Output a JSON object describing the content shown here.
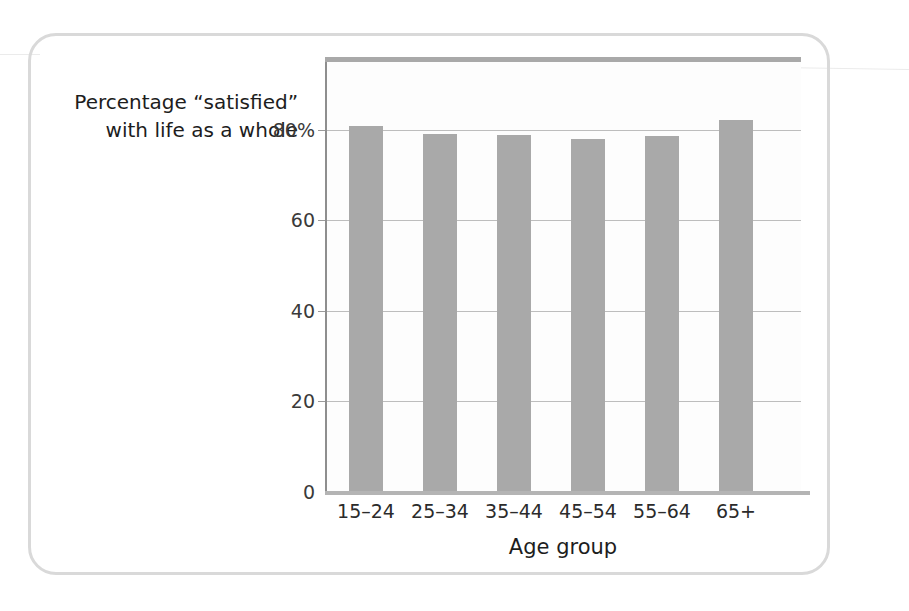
{
  "chart_data": {
    "type": "bar",
    "title": "",
    "subtitle": "",
    "categories": [
      "15–24",
      "25–34",
      "35–44",
      "45–54",
      "55–64",
      "65+"
    ],
    "values": [
      80.8,
      79.0,
      78.8,
      78.0,
      78.6,
      82.2
    ],
    "series": [
      {
        "name": "Percentage “satisfied” with life as a whole",
        "values": [
          80.8,
          79.0,
          78.8,
          78.0,
          78.6,
          82.2
        ]
      }
    ],
    "xlabel": "Age group",
    "ylabel": "Percentage “satisfied” with life as a whole",
    "ylabel_lines": [
      "Percentage “satisfied”",
      "with life as a whole"
    ],
    "ylim": [
      0,
      95
    ],
    "y_ticks": [
      0,
      20,
      40,
      60,
      80
    ],
    "y_tick_labels": [
      "0",
      "20",
      "40",
      "60",
      "80%"
    ],
    "grid": "horizontal",
    "legend": "none",
    "bar_color": "#a9a9a9",
    "gridline_color": "#bdbdbd",
    "axis_color": "#8e8e8e",
    "frame_color": "#d9d9d9",
    "background_color": "#ffffff"
  }
}
